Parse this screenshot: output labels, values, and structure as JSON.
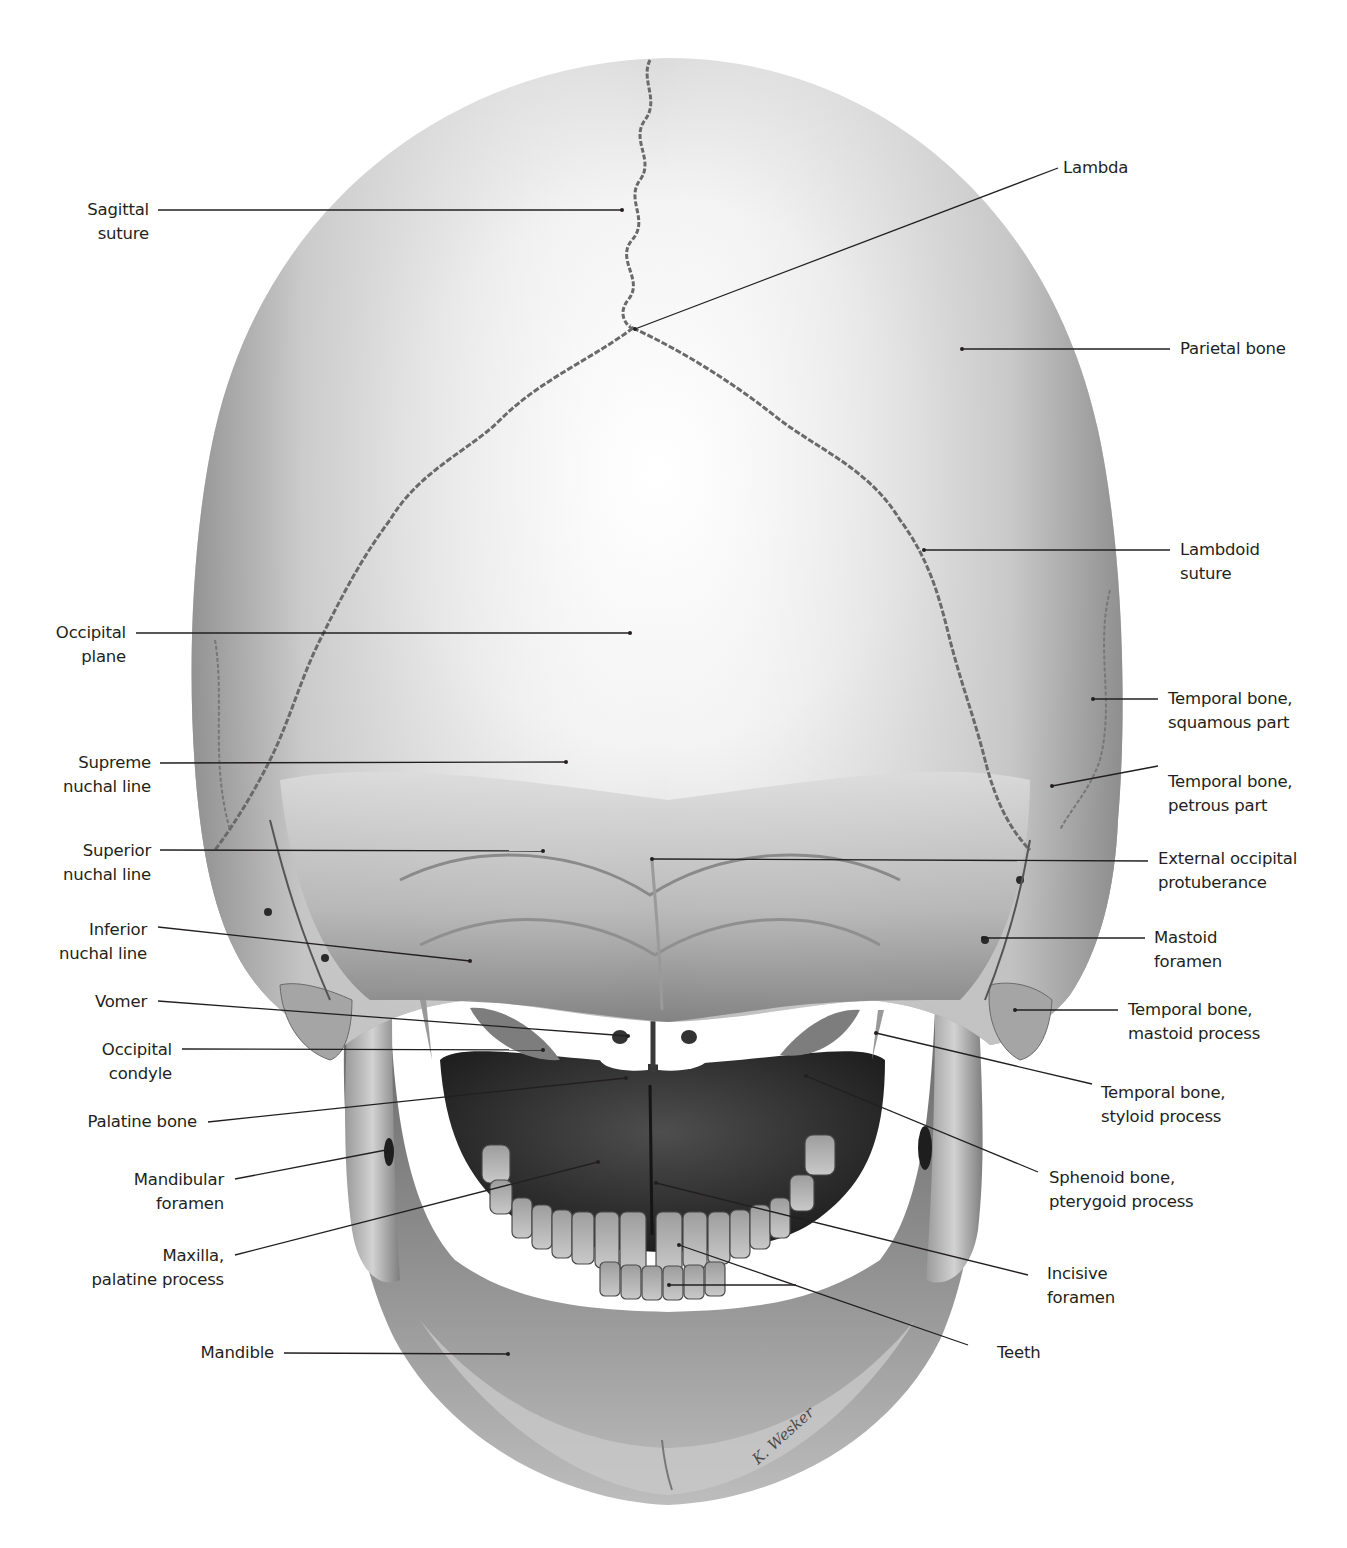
{
  "figure": {
    "colors": {
      "background": "#ffffff",
      "bone_light": "#f4f4f4",
      "bone_mid": "#b9b9b9",
      "bone_dark": "#5e5e5e",
      "cavity": "#2a2a2a",
      "leader_line": "#231f20",
      "label_text": "#231f20"
    },
    "signature": "K. Wesker"
  },
  "labels_left": [
    {
      "id": "sagittal-suture",
      "lines": [
        "Sagittal",
        "suture"
      ]
    },
    {
      "id": "occipital-plane",
      "lines": [
        "Occipital",
        "plane"
      ]
    },
    {
      "id": "supreme-nuchal-line",
      "lines": [
        "Supreme",
        "nuchal line"
      ]
    },
    {
      "id": "superior-nuchal-line",
      "lines": [
        "Superior",
        "nuchal line"
      ]
    },
    {
      "id": "inferior-nuchal-line",
      "lines": [
        "Inferior",
        "nuchal line"
      ]
    },
    {
      "id": "vomer",
      "lines": [
        "Vomer"
      ]
    },
    {
      "id": "occipital-condyle",
      "lines": [
        "Occipital",
        "condyle"
      ]
    },
    {
      "id": "palatine-bone",
      "lines": [
        "Palatine bone"
      ]
    },
    {
      "id": "mandibular-foramen",
      "lines": [
        "Mandibular",
        "foramen"
      ]
    },
    {
      "id": "maxilla-palatine-process",
      "lines": [
        "Maxilla,",
        "palatine process"
      ]
    },
    {
      "id": "mandible",
      "lines": [
        "Mandible"
      ]
    }
  ],
  "labels_right": [
    {
      "id": "lambda",
      "lines": [
        "Lambda"
      ]
    },
    {
      "id": "parietal-bone",
      "lines": [
        "Parietal bone"
      ]
    },
    {
      "id": "lambdoid-suture",
      "lines": [
        "Lambdoid",
        "suture"
      ]
    },
    {
      "id": "temporal-bone-squamous-part",
      "lines": [
        "Temporal bone,",
        "squamous part"
      ]
    },
    {
      "id": "temporal-bone-petrous-part",
      "lines": [
        "Temporal bone,",
        "petrous part"
      ]
    },
    {
      "id": "external-occipital-protuberance",
      "lines": [
        "External occipital",
        "protuberance"
      ]
    },
    {
      "id": "mastoid-foramen",
      "lines": [
        "Mastoid",
        "foramen"
      ]
    },
    {
      "id": "temporal-bone-mastoid-process",
      "lines": [
        "Temporal bone,",
        "mastoid process"
      ]
    },
    {
      "id": "temporal-bone-styloid-process",
      "lines": [
        "Temporal bone,",
        "styloid process"
      ]
    },
    {
      "id": "sphenoid-bone-pterygoid-process",
      "lines": [
        "Sphenoid bone,",
        "pterygoid process"
      ]
    },
    {
      "id": "incisive-foramen",
      "lines": [
        "Incisive",
        "foramen"
      ]
    },
    {
      "id": "teeth",
      "lines": [
        "Teeth"
      ]
    }
  ]
}
